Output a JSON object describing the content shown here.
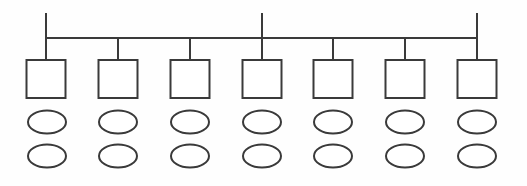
{
  "diagram": {
    "type": "node-link-diagram",
    "canvas": {
      "width": 527,
      "height": 186,
      "background": "#fefefe"
    },
    "style": {
      "stroke_color": "#3a3a3a",
      "stroke_width": 2,
      "fill_color": "#ffffff",
      "bar_stroke_width": 2
    },
    "backbone": {
      "label": "horizontal-backbone-bar",
      "x1": 46,
      "x2": 477,
      "y": 38
    },
    "uplink_stems": [
      {
        "label": "uplink-stem-1",
        "x": 46,
        "y_top": 13,
        "y_bottom": 38
      },
      {
        "label": "uplink-stem-4",
        "x": 262,
        "y_top": 13,
        "y_bottom": 38
      },
      {
        "label": "uplink-stem-7",
        "x": 477,
        "y_top": 13,
        "y_bottom": 38
      }
    ],
    "columns": [
      {
        "index": 1,
        "center_x": 46
      },
      {
        "index": 2,
        "center_x": 118
      },
      {
        "index": 3,
        "center_x": 190
      },
      {
        "index": 4,
        "center_x": 262
      },
      {
        "index": 5,
        "center_x": 333
      },
      {
        "index": 6,
        "center_x": 405
      },
      {
        "index": 7,
        "center_x": 477
      }
    ],
    "drop_stems": {
      "label": "drop-stem",
      "y_top": 38,
      "y_bottom": 60,
      "count": 7
    },
    "square_row": {
      "label": "square-node-row",
      "count": 7,
      "width": 39,
      "height": 38,
      "y_top": 60,
      "nodes": [
        {
          "name": "square-node-1",
          "cx": 46
        },
        {
          "name": "square-node-2",
          "cx": 118
        },
        {
          "name": "square-node-3",
          "cx": 190
        },
        {
          "name": "square-node-4",
          "cx": 262
        },
        {
          "name": "square-node-5",
          "cx": 333
        },
        {
          "name": "square-node-6",
          "cx": 405
        },
        {
          "name": "square-node-7",
          "cx": 477
        }
      ]
    },
    "ellipse_row_1": {
      "label": "ellipse-node-row-1",
      "count": 7,
      "rx": 19,
      "ry": 11.5,
      "cy": 122,
      "nodes": [
        {
          "name": "ellipse-node-r1-c1",
          "cx": 47
        },
        {
          "name": "ellipse-node-r1-c2",
          "cx": 118
        },
        {
          "name": "ellipse-node-r1-c3",
          "cx": 190
        },
        {
          "name": "ellipse-node-r1-c4",
          "cx": 262
        },
        {
          "name": "ellipse-node-r1-c5",
          "cx": 333
        },
        {
          "name": "ellipse-node-r1-c6",
          "cx": 405
        },
        {
          "name": "ellipse-node-r1-c7",
          "cx": 477
        }
      ]
    },
    "ellipse_row_2": {
      "label": "ellipse-node-row-2",
      "count": 7,
      "rx": 19,
      "ry": 11.5,
      "cy": 156,
      "nodes": [
        {
          "name": "ellipse-node-r2-c1",
          "cx": 47
        },
        {
          "name": "ellipse-node-r2-c2",
          "cx": 118
        },
        {
          "name": "ellipse-node-r2-c3",
          "cx": 190
        },
        {
          "name": "ellipse-node-r2-c4",
          "cx": 262
        },
        {
          "name": "ellipse-node-r2-c5",
          "cx": 333
        },
        {
          "name": "ellipse-node-r2-c6",
          "cx": 405
        },
        {
          "name": "ellipse-node-r2-c7",
          "cx": 477
        }
      ]
    }
  }
}
